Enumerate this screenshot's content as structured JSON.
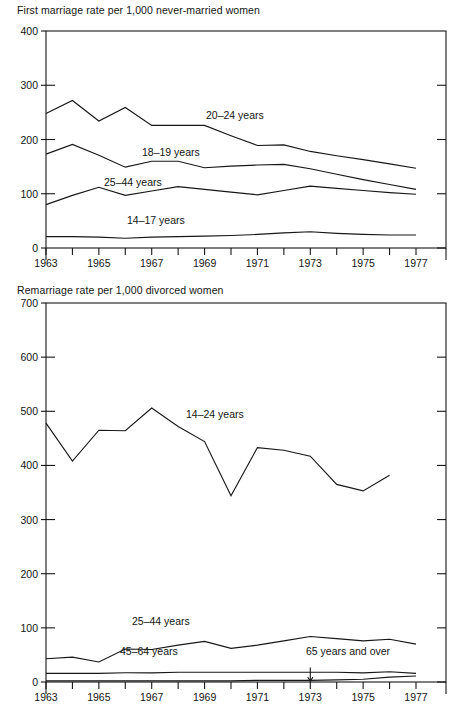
{
  "figure": {
    "background": "#ffffff",
    "ink_color": "#171717"
  },
  "charts": [
    {
      "id": "first-marriage",
      "title": "First marriage rate per 1,000 never-married women"
    },
    {
      "id": "remarriage",
      "title": "Remarriage rate per 1,000 divorced women"
    }
  ],
  "chart_data": [
    {
      "type": "line",
      "title": "First marriage rate per 1,000 never-married women",
      "xlabel": "",
      "ylabel": "",
      "grid": false,
      "legend": "inline-labels",
      "x": [
        1963,
        1964,
        1965,
        1966,
        1967,
        1968,
        1969,
        1970,
        1971,
        1972,
        1973,
        1974,
        1975,
        1976,
        1977
      ],
      "xlim": [
        1963,
        1978
      ],
      "ylim": [
        0,
        400
      ],
      "yticks": [
        0,
        100,
        200,
        300,
        400
      ],
      "ytick_labels": [
        "0",
        "100",
        "200",
        "300",
        "400"
      ],
      "xtick_labels": [
        "1963",
        "",
        "1965",
        "",
        "1967",
        "",
        "1969",
        "",
        "1971",
        "",
        "1973",
        "",
        "1975",
        "",
        "1977"
      ],
      "series": [
        {
          "name": "20-24 years",
          "label": "20–24 years",
          "values": [
            248,
            272,
            234,
            259,
            226,
            226,
            226,
            207,
            189,
            190,
            178,
            170,
            163,
            155,
            147
          ]
        },
        {
          "name": "18-19 years",
          "label": "18–19 years",
          "values": [
            173,
            191,
            171,
            149,
            160,
            160,
            148,
            151,
            153,
            154,
            146,
            136,
            126,
            117,
            108
          ]
        },
        {
          "name": "25-44 years",
          "label": "25–44 years",
          "values": [
            80,
            97,
            112,
            97,
            105,
            113,
            108,
            103,
            98,
            106,
            114,
            110,
            106,
            102,
            99
          ]
        },
        {
          "name": "14-17 years",
          "label": "14–17 years",
          "values": [
            21,
            21,
            20,
            18,
            20,
            21,
            22,
            23,
            25,
            28,
            30,
            27,
            25,
            24,
            24
          ]
        }
      ]
    },
    {
      "type": "line",
      "title": "Remarriage rate per 1,000 divorced women",
      "xlabel": "",
      "ylabel": "",
      "grid": false,
      "legend": "inline-labels",
      "x": [
        1963,
        1964,
        1965,
        1966,
        1967,
        1968,
        1969,
        1970,
        1971,
        1972,
        1973,
        1974,
        1975,
        1976,
        1977
      ],
      "xlim": [
        1963,
        1978
      ],
      "ylim": [
        0,
        700
      ],
      "yticks": [
        0,
        100,
        200,
        300,
        400,
        500,
        600,
        700
      ],
      "ytick_labels": [
        "0",
        "100",
        "200",
        "300",
        "400",
        "500",
        "600",
        "700"
      ],
      "xtick_labels": [
        "1963",
        "",
        "1965",
        "",
        "1967",
        "",
        "1969",
        "",
        "1971",
        "",
        "1973",
        "",
        "1975",
        "",
        "1977"
      ],
      "series": [
        {
          "name": "14-24 years",
          "label": "14–24 years",
          "values": [
            478,
            408,
            465,
            464,
            506,
            472,
            444,
            344,
            433,
            428,
            417,
            365,
            353,
            382,
            null
          ]
        },
        {
          "name": "25-44 years",
          "label": "25–44 years",
          "values": [
            43,
            46,
            37,
            61,
            60,
            68,
            75,
            62,
            68,
            76,
            84,
            80,
            76,
            79,
            70
          ]
        },
        {
          "name": "45-64 years",
          "label": "45–64 years",
          "values": [
            16,
            16,
            16,
            17,
            17,
            18,
            18,
            18,
            18,
            18,
            18,
            18,
            17,
            19,
            16
          ]
        },
        {
          "name": "65 years and over",
          "label": "65 years and over",
          "values": [
            2,
            2,
            2,
            2,
            2,
            2,
            2,
            2,
            3,
            3,
            3,
            4,
            5,
            9,
            11
          ]
        }
      ],
      "annotation": {
        "label": "65 years and over",
        "pointer_year": 1973
      }
    }
  ]
}
